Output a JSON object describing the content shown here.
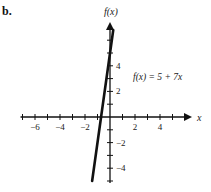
{
  "panel_label": "b.",
  "chart_data": {
    "type": "line",
    "title": "",
    "xlabel": "x",
    "ylabel": "f(x)",
    "equation_label": "f(x) = 5 + 7x",
    "function": {
      "intercept": 5,
      "slope": 7
    },
    "series": [
      {
        "name": "f(x) = 5 + 7x",
        "x": [
          -1.43,
          0.26
        ],
        "y": [
          -5,
          6.8
        ]
      }
    ],
    "x_ticks": [
      -7,
      -6,
      -5,
      -4,
      -3,
      -2,
      -1,
      1,
      2,
      3,
      4,
      5
    ],
    "x_tick_labels": [
      "-6",
      "-4",
      "-2",
      "2",
      "4"
    ],
    "x_tick_label_values": [
      -6,
      -4,
      -2,
      2,
      4
    ],
    "y_ticks": [
      -5,
      -4,
      -3,
      -2,
      -1,
      1,
      2,
      3,
      4,
      5,
      6
    ],
    "y_tick_labels": [
      "4",
      "2",
      "-2",
      "-4"
    ],
    "y_tick_label_values": [
      4,
      2,
      -2,
      -4
    ],
    "xlim": [
      -7,
      6
    ],
    "ylim": [
      -5,
      7
    ],
    "grid": false,
    "legend": "none"
  },
  "layout": {
    "origin_px": [
      110,
      117
    ],
    "unit_x_px": 12.5,
    "unit_y_px": 12.8
  }
}
